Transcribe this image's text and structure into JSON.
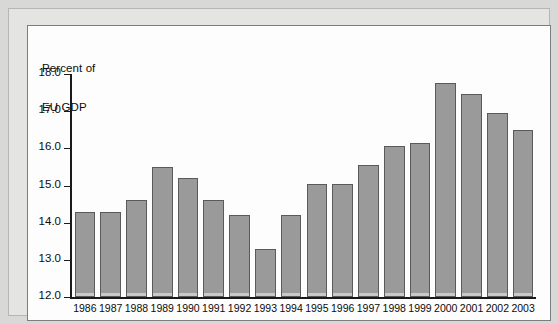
{
  "figure": {
    "axis_title_line1": "Percent of",
    "axis_title_line2": "EU GDP"
  },
  "chart_data": {
    "type": "bar",
    "title": "",
    "subtitle": "",
    "xlabel": "",
    "ylabel": "Percent of EU GDP",
    "ylim": [
      12.0,
      18.0
    ],
    "ytick_labels": [
      "18.0",
      "17.0",
      "16.0",
      "15.0",
      "14.0",
      "13.0",
      "12.0"
    ],
    "yticks": [
      18.0,
      17.0,
      16.0,
      15.0,
      14.0,
      13.0,
      12.0
    ],
    "grid": false,
    "legend": null,
    "bar_color": "#9a9a9a",
    "bar_edge_color": "#5a5a5a",
    "categories": [
      "1986",
      "1987",
      "1988",
      "1989",
      "1990",
      "1991",
      "1992",
      "1993",
      "1994",
      "1995",
      "1996",
      "1997",
      "1998",
      "1999",
      "2000",
      "2001",
      "2002",
      "2003"
    ],
    "values": [
      14.3,
      14.3,
      14.6,
      15.5,
      15.2,
      14.6,
      14.2,
      13.28,
      14.2,
      15.05,
      15.05,
      15.55,
      16.05,
      16.15,
      17.75,
      17.45,
      16.95,
      16.5
    ]
  }
}
